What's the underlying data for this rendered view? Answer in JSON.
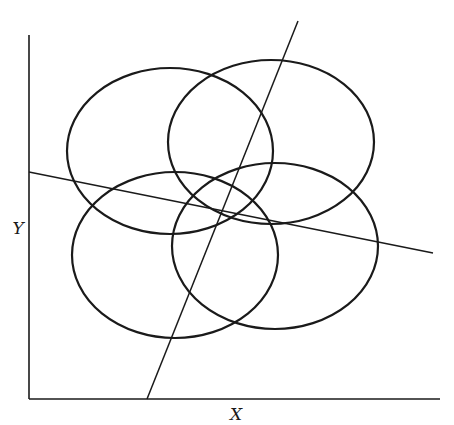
{
  "figure": {
    "background": "#ffffff",
    "stroke_color": "#1a1a1a",
    "axes": {
      "x_label": "X",
      "y_label": "Y",
      "origin": [
        29,
        399
      ],
      "x_end": [
        440,
        399
      ],
      "y_end": [
        29,
        35
      ],
      "x_label_pos": [
        236,
        420
      ],
      "y_label_pos": [
        18,
        234
      ]
    },
    "ellipses": [
      {
        "name": "ellipse-top-left",
        "cx": 170,
        "cy": 151,
        "rx": 103,
        "ry": 83
      },
      {
        "name": "ellipse-top-right",
        "cx": 271,
        "cy": 142,
        "rx": 103,
        "ry": 82
      },
      {
        "name": "ellipse-bottom-left",
        "cx": 175,
        "cy": 255,
        "rx": 103,
        "ry": 83
      },
      {
        "name": "ellipse-bottom-right",
        "cx": 275,
        "cy": 246,
        "rx": 103,
        "ry": 83
      }
    ],
    "lines": [
      {
        "name": "steep-discriminant-line",
        "x1": 298,
        "y1": 21,
        "x2": 147,
        "y2": 399
      },
      {
        "name": "shallow-discriminant-line",
        "x1": 29,
        "y1": 172,
        "x2": 433,
        "y2": 253
      }
    ]
  }
}
